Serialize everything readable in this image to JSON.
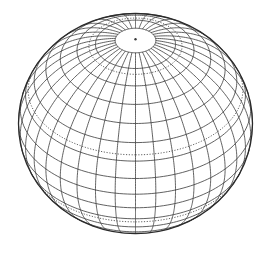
{
  "figure": {
    "title": "Wireframe globe"
  },
  "globe": {
    "width": 271,
    "height": 254,
    "center": [
      135.5,
      123.5
    ],
    "radius_x": 117,
    "radius_y": 110,
    "view_elevation_deg": 40,
    "view_longitude_deg": 0,
    "meridian_step_deg": 10,
    "parallel_step_deg": 10,
    "parallel_min_deg": -80,
    "parallel_max_deg": 80,
    "dashed_parallels_deg": [
      66.56,
      23.44,
      -23.44,
      -66.56
    ],
    "pole_dot": true,
    "colors": {
      "background": "#ffffff",
      "line": "#3a3a3a",
      "outline": "#2a2a2a"
    },
    "line_width": 0.8,
    "outline_width": 1.3
  }
}
